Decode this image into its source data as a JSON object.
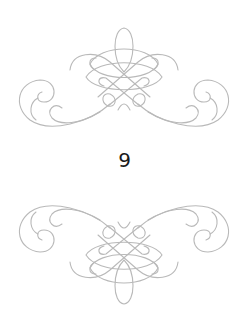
{
  "page": {
    "number": "9",
    "ornament_color": "#b9b9b9",
    "text_color": "#1a1a1a"
  },
  "ornaments": [
    {
      "position": "top",
      "icon": "flourish-ornament-icon"
    },
    {
      "position": "bottom",
      "icon": "flourish-ornament-icon"
    }
  ]
}
